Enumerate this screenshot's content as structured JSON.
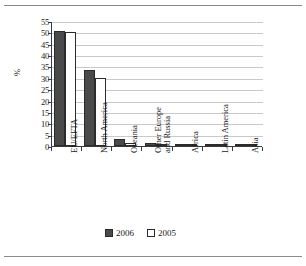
{
  "chart_data": {
    "type": "bar",
    "title": "",
    "xlabel": "",
    "ylabel": "%",
    "ylim": [
      0,
      55
    ],
    "yticks": [
      0,
      5,
      10,
      15,
      20,
      25,
      30,
      35,
      40,
      45,
      50,
      55
    ],
    "grid": true,
    "legend_position": "bottom",
    "categories": [
      "EU/EFTA",
      "North America",
      "Oceania",
      "Other Europe and Russia",
      "Africa",
      "Latin America",
      "Asia"
    ],
    "category_lines": [
      [
        "EU/EFTA"
      ],
      [
        "North America"
      ],
      [
        "Oceania"
      ],
      [
        "Other Europe",
        "and Russia"
      ],
      [
        "Africa"
      ],
      [
        "Latin America"
      ],
      [
        "Asia"
      ]
    ],
    "series": [
      {
        "name": "2006",
        "color": "#4a4a4a",
        "values": [
          50.6,
          33.6,
          3.1,
          1.3,
          0.3,
          1.0,
          0.1
        ]
      },
      {
        "name": "2005",
        "color": "#ffffff",
        "values": [
          50.3,
          29.9,
          1.5,
          0.6,
          0.7,
          0.2,
          0.1
        ]
      }
    ]
  },
  "legend": {
    "items": [
      {
        "label": "2006"
      },
      {
        "label": "2005"
      }
    ]
  },
  "axis": {
    "y_title": "%"
  }
}
